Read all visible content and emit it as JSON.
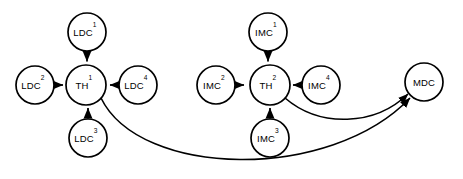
{
  "diagram": {
    "type": "directed-graph",
    "background_color": "#ffffff",
    "stroke_color": "#000000",
    "nodes": [
      {
        "id": "ldc1",
        "base": "LDC",
        "sup": "1",
        "cx": 87,
        "cy": 32,
        "r": 19
      },
      {
        "id": "ldc2",
        "base": "LDC",
        "sup": "2",
        "cx": 35,
        "cy": 85,
        "r": 19
      },
      {
        "id": "th1",
        "base": "TH",
        "sup": "1",
        "cx": 86,
        "cy": 85,
        "r": 20
      },
      {
        "id": "ldc4",
        "base": "LDC",
        "sup": "4",
        "cx": 138,
        "cy": 85,
        "r": 19
      },
      {
        "id": "ldc3",
        "base": "LDC",
        "sup": "3",
        "cx": 88,
        "cy": 138,
        "r": 19
      },
      {
        "id": "imc1",
        "base": "IMC",
        "sup": "1",
        "cx": 268,
        "cy": 32,
        "r": 19
      },
      {
        "id": "imc2",
        "base": "IMC",
        "sup": "2",
        "cx": 216,
        "cy": 85,
        "r": 19
      },
      {
        "id": "th2",
        "base": "TH",
        "sup": "2",
        "cx": 270,
        "cy": 85,
        "r": 20
      },
      {
        "id": "imc4",
        "base": "IMC",
        "sup": "4",
        "cx": 321,
        "cy": 85,
        "r": 19
      },
      {
        "id": "imc3",
        "base": "IMC",
        "sup": "3",
        "cx": 270,
        "cy": 138,
        "r": 19
      },
      {
        "id": "mdc",
        "base": "MDC",
        "sup": "",
        "cx": 424,
        "cy": 82,
        "r": 19
      }
    ],
    "edges": [
      {
        "id": "e-ldc1-th1",
        "from": "ldc1",
        "to": "th1",
        "shape": "straight",
        "d": "M 87 51.5 L 87 61.5"
      },
      {
        "id": "e-ldc2-th1",
        "from": "ldc2",
        "to": "th1",
        "shape": "straight",
        "d": "M 54.5 85 L 63 85"
      },
      {
        "id": "e-ldc4-th1",
        "from": "ldc4",
        "to": "th1",
        "shape": "straight",
        "d": "M 118.5 85 L 110 85"
      },
      {
        "id": "e-ldc3-th1",
        "from": "ldc3",
        "to": "th1",
        "shape": "straight",
        "d": "M 88 118.5 L 88 108"
      },
      {
        "id": "e-imc1-th2",
        "from": "imc1",
        "to": "th2",
        "shape": "straight",
        "d": "M 268 51.5 L 268 61.5"
      },
      {
        "id": "e-imc2-th2",
        "from": "imc2",
        "to": "th2",
        "shape": "straight",
        "d": "M 235.5 85 L 244 85"
      },
      {
        "id": "e-imc4-th2",
        "from": "imc4",
        "to": "th2",
        "shape": "straight",
        "d": "M 301.5 85 L 293 85"
      },
      {
        "id": "e-imc3-th2",
        "from": "imc3",
        "to": "th2",
        "shape": "straight",
        "d": "M 270 118.5 L 270 108"
      },
      {
        "id": "e-th2-mdc",
        "from": "th2",
        "to": "mdc",
        "shape": "curve",
        "d": "M 285 98 C 320 128, 375 126, 408 94"
      },
      {
        "id": "e-th1-mdc",
        "from": "th1",
        "to": "mdc",
        "shape": "curve",
        "d": "M 101 98 C 140 178, 330 182, 410 98"
      }
    ]
  }
}
